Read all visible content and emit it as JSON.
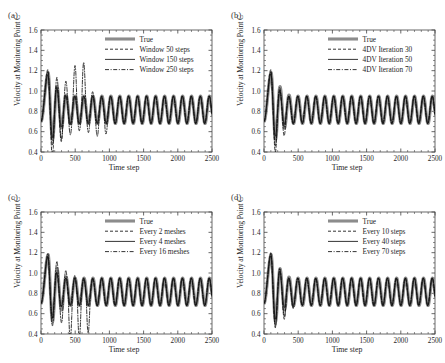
{
  "figure": {
    "panels": [
      {
        "label": "(a)",
        "xlabel": "Time step",
        "ylabel": "Velocity at Monitoring Point C",
        "legend": [
          "True",
          "Window 50 steps",
          "Window 150 steps",
          "Window 250 steps"
        ]
      },
      {
        "label": "(b)",
        "xlabel": "Time step",
        "ylabel": "Velocity at Monitoring Point C",
        "legend": [
          "True",
          "4DV Iteration 30",
          "4DV Iteration 50",
          "4DV Iteration 70"
        ]
      },
      {
        "label": "(c)",
        "xlabel": "Time step",
        "ylabel": "Velocity at Monitoring Point C",
        "legend": [
          "True",
          "Every 2 meshes",
          "Every 4 meshes",
          "Every 16 meshes"
        ]
      },
      {
        "label": "(d)",
        "xlabel": "Time step",
        "ylabel": "Velocity at Monitoring Point C",
        "legend": [
          "True",
          "Every 10 steps",
          "Every 40 steps",
          "Every 70 steps"
        ]
      }
    ],
    "xticks": [
      "0",
      "500",
      "1000",
      "1500",
      "2000",
      "2500"
    ],
    "yticks": [
      "0.4",
      "0.6",
      "0.8",
      "1.0",
      "1.2",
      "1.4",
      "1.6"
    ],
    "colors": {
      "true_curve": "#8c8c8c",
      "comparison_curve": "#111111",
      "axis": "#444444",
      "background": "#ffffff"
    }
  },
  "chart_data": [
    {
      "type": "line",
      "panel": "(a)",
      "title": "",
      "xlabel": "Time step",
      "ylabel": "Velocity at Monitoring Point C",
      "xlim": [
        0,
        2500
      ],
      "ylim": [
        0.4,
        1.6
      ],
      "xticks": [
        0,
        500,
        1000,
        1500,
        2000,
        2500
      ],
      "yticks": [
        0.4,
        0.6,
        0.8,
        1.0,
        1.2,
        1.4,
        1.6
      ],
      "grid": false,
      "legend_position": "upper right",
      "series": [
        {
          "name": "True",
          "style": "thick-solid-gray",
          "period": 131,
          "settle_x": 420,
          "baseline": 0.815,
          "amplitude_steady": 0.135,
          "peak_x": 105,
          "peak_y": 1.18,
          "start_y": 0.7
        },
        {
          "name": "Window 50 steps",
          "style": "dashed",
          "period": 131,
          "settle_x": 430,
          "baseline": 0.815,
          "amplitude_steady": 0.135,
          "peak_x": 100,
          "peak_y": 1.21,
          "start_y": 0.7,
          "transient_min_x": 195,
          "transient_min_y": 0.5,
          "transient_extra_dip_x": 330,
          "transient_extra_dip_y": 0.56
        },
        {
          "name": "Window 150 steps",
          "style": "thin-solid",
          "period": 131,
          "settle_x": 400,
          "baseline": 0.815,
          "amplitude_steady": 0.135,
          "peak_x": 103,
          "peak_y": 1.16,
          "start_y": 0.7
        },
        {
          "name": "Window 250 steps",
          "style": "dash-dot",
          "period": 131,
          "settle_x": 1000,
          "baseline": 0.815,
          "amplitude_steady": 0.135,
          "peak_x": 102,
          "peak_y": 1.19,
          "start_y": 0.7,
          "secondary_peak_x": 575,
          "secondary_peak_y": 1.28,
          "transient_min_x": 760,
          "transient_min_y": 0.56,
          "transient_extra_dip_x": 900,
          "transient_extra_dip_y": 0.51
        }
      ]
    },
    {
      "type": "line",
      "panel": "(b)",
      "title": "",
      "xlabel": "Time step",
      "ylabel": "Velocity at Monitoring Point C",
      "xlim": [
        0,
        2500
      ],
      "ylim": [
        0.4,
        1.6
      ],
      "xticks": [
        0,
        500,
        1000,
        1500,
        2000,
        2500
      ],
      "yticks": [
        0.4,
        0.6,
        0.8,
        1.0,
        1.2,
        1.4,
        1.6
      ],
      "grid": false,
      "legend_position": "upper right",
      "series": [
        {
          "name": "True",
          "style": "thick-solid-gray",
          "period": 131,
          "settle_x": 420,
          "baseline": 0.815,
          "amplitude_steady": 0.135,
          "peak_x": 105,
          "peak_y": 1.18,
          "start_y": 0.7
        },
        {
          "name": "4DV Iteration 30",
          "style": "dashed",
          "period": 131,
          "settle_x": 400,
          "baseline": 0.815,
          "amplitude_steady": 0.135,
          "peak_x": 100,
          "peak_y": 1.21,
          "start_y": 0.7,
          "transient_min_x": 200,
          "transient_min_y": 0.54,
          "transient_extra_dip_x": 320,
          "transient_extra_dip_y": 0.62
        },
        {
          "name": "4DV Iteration 50",
          "style": "thin-solid",
          "period": 131,
          "settle_x": 330,
          "baseline": 0.815,
          "amplitude_steady": 0.135,
          "peak_x": 103,
          "peak_y": 1.17,
          "start_y": 0.7
        },
        {
          "name": "4DV Iteration 70",
          "style": "dash-dot",
          "period": 131,
          "settle_x": 350,
          "baseline": 0.815,
          "amplitude_steady": 0.135,
          "peak_x": 102,
          "peak_y": 1.19,
          "start_y": 0.7,
          "transient_min_x": 205,
          "transient_min_y": 0.58
        }
      ]
    },
    {
      "type": "line",
      "panel": "(c)",
      "title": "",
      "xlabel": "Time step",
      "ylabel": "Velocity at Monitoring Point C",
      "xlim": [
        0,
        2500
      ],
      "ylim": [
        0.4,
        1.6
      ],
      "xticks": [
        0,
        500,
        1000,
        1500,
        2000,
        2500
      ],
      "yticks": [
        0.4,
        0.6,
        0.8,
        1.0,
        1.2,
        1.4,
        1.6
      ],
      "grid": false,
      "legend_position": "upper right",
      "series": [
        {
          "name": "True",
          "style": "thick-solid-gray",
          "period": 131,
          "settle_x": 420,
          "baseline": 0.815,
          "amplitude_steady": 0.135,
          "peak_x": 105,
          "peak_y": 1.18,
          "start_y": 0.7
        },
        {
          "name": "Every 2 meshes",
          "style": "dashed",
          "period": 131,
          "settle_x": 330,
          "baseline": 0.815,
          "amplitude_steady": 0.135,
          "peak_x": 100,
          "peak_y": 1.17,
          "start_y": 0.7
        },
        {
          "name": "Every 4 meshes",
          "style": "thin-solid",
          "period": 131,
          "settle_x": 340,
          "baseline": 0.815,
          "amplitude_steady": 0.135,
          "peak_x": 103,
          "peak_y": 1.16,
          "start_y": 0.7
        },
        {
          "name": "Every 16 meshes",
          "style": "dash-dot",
          "period": 131,
          "settle_x": 760,
          "baseline": 0.815,
          "amplitude_steady": 0.135,
          "peak_x": 102,
          "peak_y": 1.19,
          "start_y": 0.7,
          "transient_min_x": 400,
          "transient_min_y": 0.4,
          "transient_extra_dip_x": 545,
          "transient_extra_dip_y": 0.4,
          "transient_third_dip_x": 675,
          "transient_third_dip_y": 0.41
        }
      ]
    },
    {
      "type": "line",
      "panel": "(d)",
      "title": "",
      "xlabel": "Time step",
      "ylabel": "Velocity at Monitoring Point C",
      "xlim": [
        0,
        2500
      ],
      "ylim": [
        0.4,
        1.6
      ],
      "xticks": [
        0,
        500,
        1000,
        1500,
        2000,
        2500
      ],
      "yticks": [
        0.4,
        0.6,
        0.8,
        1.0,
        1.2,
        1.4,
        1.6
      ],
      "grid": false,
      "legend_position": "upper right",
      "series": [
        {
          "name": "True",
          "style": "thick-solid-gray",
          "period": 131,
          "settle_x": 420,
          "baseline": 0.815,
          "amplitude_steady": 0.135,
          "peak_x": 105,
          "peak_y": 1.18,
          "start_y": 0.7
        },
        {
          "name": "Every 10 steps",
          "style": "dashed",
          "period": 131,
          "settle_x": 420,
          "baseline": 0.815,
          "amplitude_steady": 0.135,
          "peak_x": 100,
          "peak_y": 1.2,
          "start_y": 0.7,
          "transient_min_x": 215,
          "transient_min_y": 0.6,
          "transient_extra_dip_x": 345,
          "transient_extra_dip_y": 0.58
        },
        {
          "name": "Every 40 steps",
          "style": "thin-solid",
          "period": 131,
          "settle_x": 360,
          "baseline": 0.815,
          "amplitude_steady": 0.135,
          "peak_x": 103,
          "peak_y": 1.17,
          "start_y": 0.7
        },
        {
          "name": "Every 70 steps",
          "style": "dash-dot",
          "period": 131,
          "settle_x": 420,
          "baseline": 0.815,
          "amplitude_steady": 0.135,
          "peak_x": 102,
          "peak_y": 1.19,
          "start_y": 0.7,
          "transient_min_x": 210,
          "transient_min_y": 0.62,
          "transient_extra_dip_x": 350,
          "transient_extra_dip_y": 0.6
        }
      ]
    }
  ]
}
